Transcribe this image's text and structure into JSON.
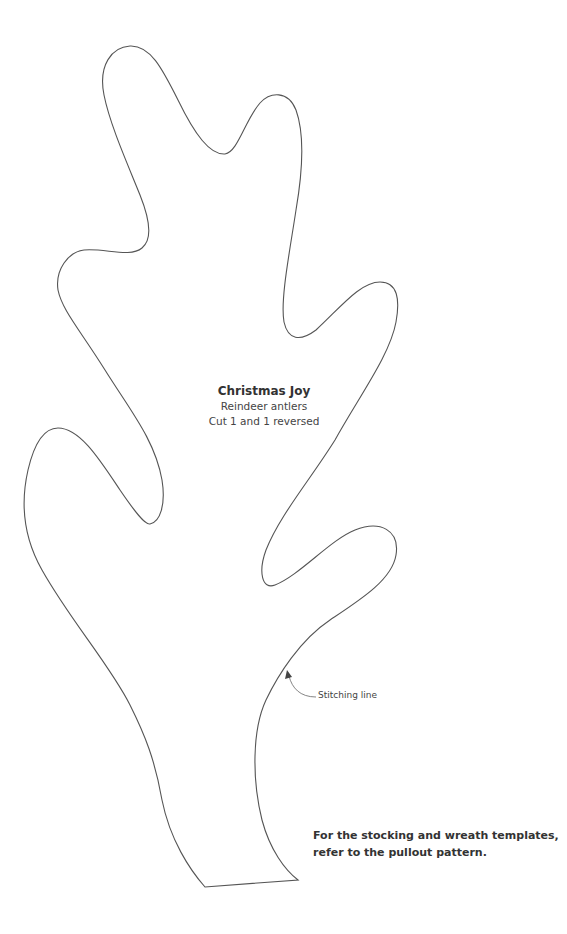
{
  "template": {
    "title": "Christmas Joy",
    "subtitle": "Reindeer antlers",
    "instruction": "Cut 1 and 1 reversed",
    "outline_color": "#555555"
  },
  "annotation": {
    "stitch_label": "Stitching line"
  },
  "note": {
    "line1": "For the stocking and wreath templates,",
    "line2": "refer to the pullout pattern."
  }
}
